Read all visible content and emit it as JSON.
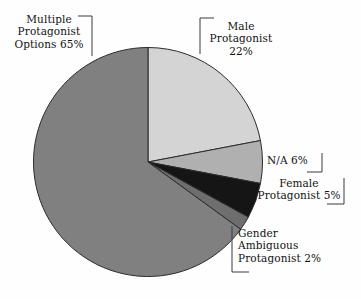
{
  "chart_data": {
    "type": "pie",
    "title": "",
    "subtitle": "",
    "xlabel": "",
    "ylabel": "",
    "legend_position": "none",
    "grid": false,
    "start_angle_deg": 0,
    "direction": "clockwise",
    "categories": [
      "Male Protagonist",
      "N/A",
      "Female Protagonist",
      "Gender Ambiguous Protagonist",
      "Multiple Protagonist Options"
    ],
    "values": [
      22,
      6,
      5,
      2,
      65
    ],
    "unit": "%",
    "colors": [
      "#d4d4d4",
      "#b0b0b0",
      "#151515",
      "#6e6e6e",
      "#808080"
    ],
    "slice_outline_color": "#2b2b2b",
    "background_color": "#fefefe",
    "slices": [
      {
        "name": "Male Protagonist",
        "value": 22,
        "color": "#d4d4d4",
        "label_lines": [
          "Male",
          "Protagonist",
          "22%"
        ]
      },
      {
        "name": "N/A",
        "value": 6,
        "color": "#b0b0b0",
        "label_lines": [
          "N/A 6%"
        ]
      },
      {
        "name": "Female Protagonist",
        "value": 5,
        "color": "#151515",
        "label_lines": [
          "Female",
          "Protagonist 5%"
        ]
      },
      {
        "name": "Gender Ambiguous Protagonist",
        "value": 2,
        "color": "#6e6e6e",
        "label_lines": [
          "Gender",
          "Ambiguous",
          "Protagonist 2%"
        ]
      },
      {
        "name": "Multiple Protagonist Options",
        "value": 65,
        "color": "#808080",
        "label_lines": [
          "Multiple",
          "Protagonist",
          "Options 65%"
        ]
      }
    ]
  },
  "labels": {
    "multiple": "Multiple\nProtagonist\nOptions 65%",
    "male": "Male\nProtagonist\n22%",
    "na": "N/A 6%",
    "female": "Female\nProtagonist 5%",
    "gender": "Gender\nAmbiguous\nProtagonist 2%"
  }
}
